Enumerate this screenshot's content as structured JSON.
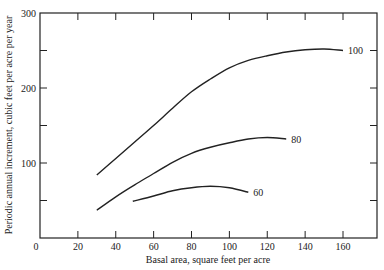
{
  "chart_data": {
    "type": "line",
    "title": "",
    "xlabel": "Basal area, square feet per acre",
    "ylabel": "Periodic annual increment, cubic feet per acre per year",
    "xlim": [
      0,
      180
    ],
    "ylim": [
      0,
      300
    ],
    "x_ticks": [
      0,
      20,
      40,
      60,
      80,
      100,
      120,
      140,
      160
    ],
    "x_tick_labels": [
      "0",
      "20",
      "40",
      "60",
      "80",
      "100",
      "120",
      "140",
      "160"
    ],
    "y_ticks": [
      0,
      50,
      100,
      150,
      200,
      250,
      300
    ],
    "y_tick_labels": [
      "",
      "",
      "100",
      "",
      "200",
      "",
      "300"
    ],
    "grid": false,
    "legend": "inline labels at curve ends",
    "series": [
      {
        "name": "100",
        "points": [
          [
            30,
            84
          ],
          [
            40,
            106
          ],
          [
            50,
            128
          ],
          [
            60,
            150
          ],
          [
            70,
            173
          ],
          [
            80,
            195
          ],
          [
            90,
            212
          ],
          [
            100,
            227
          ],
          [
            110,
            237
          ],
          [
            120,
            243
          ],
          [
            130,
            248
          ],
          [
            140,
            251
          ],
          [
            150,
            252
          ],
          [
            160,
            250
          ]
        ]
      },
      {
        "name": "80",
        "points": [
          [
            30,
            37
          ],
          [
            40,
            55
          ],
          [
            50,
            71
          ],
          [
            60,
            86
          ],
          [
            70,
            101
          ],
          [
            80,
            113
          ],
          [
            90,
            121
          ],
          [
            100,
            127
          ],
          [
            110,
            132
          ],
          [
            120,
            134
          ],
          [
            130,
            132
          ]
        ]
      },
      {
        "name": "60",
        "points": [
          [
            49,
            49
          ],
          [
            60,
            56
          ],
          [
            70,
            63
          ],
          [
            80,
            67
          ],
          [
            90,
            69
          ],
          [
            100,
            67
          ],
          [
            110,
            61
          ]
        ]
      }
    ]
  }
}
